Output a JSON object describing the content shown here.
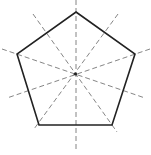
{
  "diagram": {
    "title": "Regular pentagon with 5 lines of symmetry",
    "shape": "regular-pentagon",
    "symmetry_lines": 5,
    "colors": {
      "outline": "#222222",
      "axis": "#777777",
      "background": "#ffffff"
    },
    "center": [
      75.5,
      74
    ],
    "vertices": [
      [
        76,
        12
      ],
      [
        135,
        54
      ],
      [
        112,
        125
      ],
      [
        39,
        125
      ],
      [
        17,
        54
      ]
    ],
    "axes": [
      {
        "from": [
          76,
          0
        ],
        "to": [
          76,
          150
        ]
      },
      {
        "from": [
          150,
          49
        ],
        "to": [
          7,
          98
        ]
      },
      {
        "from": [
          118,
          14
        ],
        "to": [
          34,
          129
        ]
      },
      {
        "from": [
          33,
          14
        ],
        "to": [
          117,
          132
        ]
      },
      {
        "from": [
          2,
          49
        ],
        "to": [
          145,
          98
        ]
      }
    ]
  }
}
